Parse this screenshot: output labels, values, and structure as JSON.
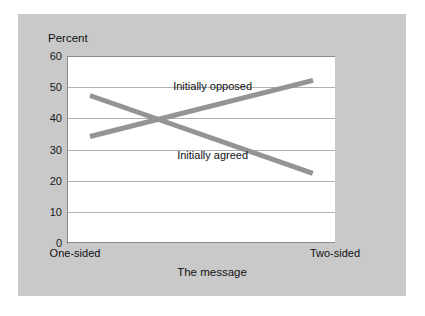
{
  "chart_data": {
    "type": "line",
    "title": "",
    "xlabel": "The message",
    "ylabel": "Percent",
    "categories": [
      "One-sided",
      "Two-sided"
    ],
    "ylim": [
      0,
      60
    ],
    "yticks": [
      0,
      10,
      20,
      30,
      40,
      50,
      60
    ],
    "grid": true,
    "legend_position": "inline-annotations",
    "series": [
      {
        "name": "Initially opposed",
        "values": [
          35,
          53
        ],
        "color": "#949494"
      },
      {
        "name": "Initially agreed",
        "values": [
          48,
          23
        ],
        "color": "#949494"
      }
    ],
    "annotations": [
      {
        "text": "Initially opposed",
        "x": 0.55,
        "y": 50
      },
      {
        "text": "Initially agreed",
        "x": 0.55,
        "y": 28
      }
    ]
  },
  "figure": {
    "panel_color": "#c9c9c9",
    "plot_background": "#ffffff",
    "gridline_color": "#b0b0b0",
    "axis_color": "#8a8a8a"
  }
}
